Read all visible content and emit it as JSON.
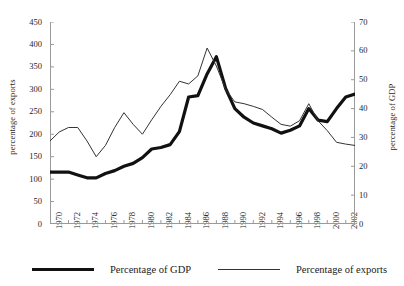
{
  "chart_data": {
    "type": "line",
    "title": "",
    "xlabel": "",
    "ylabel": "percentage of exports",
    "ylabel_right": "percentage of GDP",
    "grid": false,
    "legend_position": "bottom",
    "xlim": [
      1970,
      2003
    ],
    "ylim": [
      0,
      450
    ],
    "ylim_right": [
      0,
      70
    ],
    "yticks": [
      0,
      50,
      100,
      150,
      200,
      250,
      300,
      350,
      400,
      450
    ],
    "yticks_right": [
      0,
      10,
      20,
      30,
      40,
      50,
      60,
      70
    ],
    "xticks": [
      1970,
      1972,
      1974,
      1976,
      1978,
      1980,
      1982,
      1984,
      1986,
      1988,
      1990,
      1992,
      1994,
      1996,
      1998,
      2000,
      2002
    ],
    "x": [
      1970,
      1971,
      1972,
      1973,
      1974,
      1975,
      1976,
      1977,
      1978,
      1979,
      1980,
      1981,
      1982,
      1983,
      1984,
      1985,
      1986,
      1987,
      1988,
      1989,
      1990,
      1991,
      1992,
      1993,
      1994,
      1995,
      1996,
      1997,
      1998,
      1999,
      2000,
      2001,
      2002,
      2003
    ],
    "series": [
      {
        "name": "Percentage of GDP",
        "axis": "right",
        "unit": "%",
        "style": "thick",
        "color": "#111111",
        "values": [
          18.0,
          18.0,
          18.0,
          17.0,
          16.0,
          16.0,
          17.5,
          18.5,
          20.0,
          21.0,
          23.0,
          26.0,
          26.5,
          27.5,
          32.0,
          44.0,
          44.5,
          52.0,
          58.0,
          47.0,
          40.0,
          37.0,
          35.0,
          34.0,
          33.0,
          31.5,
          32.5,
          34.0,
          40.0,
          36.0,
          35.5,
          40.0,
          44.0,
          45.0
        ]
      },
      {
        "name": "Percentage of exports",
        "axis": "left",
        "unit": "%",
        "style": "thin",
        "color": "#333333",
        "values": [
          185,
          205,
          215,
          215,
          185,
          150,
          175,
          215,
          248,
          222,
          200,
          232,
          262,
          288,
          318,
          312,
          330,
          392,
          352,
          300,
          272,
          268,
          262,
          255,
          238,
          222,
          218,
          230,
          268,
          230,
          208,
          182,
          178,
          175
        ]
      }
    ]
  },
  "legend": {
    "items": [
      {
        "label": "Percentage of GDP",
        "style": "thick"
      },
      {
        "label": "Percentage of exports",
        "style": "thin"
      }
    ]
  }
}
